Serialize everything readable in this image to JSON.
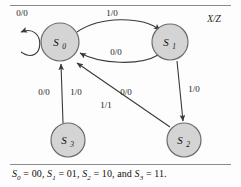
{
  "figure": {
    "type": "state-transition-diagram",
    "legend": "X/Z",
    "caption": "S0 = 00, S1 = 01, S2 = 10, and S3 = 11."
  },
  "states": [
    {
      "id": "S0",
      "name": "S",
      "sub": "0",
      "cx": 60,
      "cy": 42,
      "r": 19,
      "encoding": "00"
    },
    {
      "id": "S1",
      "name": "S",
      "sub": "1",
      "cx": 170,
      "cy": 42,
      "r": 18,
      "encoding": "01"
    },
    {
      "id": "S2",
      "name": "S",
      "sub": "2",
      "cx": 184,
      "cy": 140,
      "r": 17,
      "encoding": "10"
    },
    {
      "id": "S3",
      "name": "S",
      "sub": "3",
      "cx": 68,
      "cy": 140,
      "r": 17,
      "encoding": "11"
    }
  ],
  "transitions": [
    {
      "from": "S0",
      "to": "S0",
      "label": "0/0",
      "kind": "self-loop",
      "lx": 22,
      "ly": 16
    },
    {
      "from": "S0",
      "to": "S1",
      "label": "1/0",
      "kind": "curve-top",
      "lx": 112,
      "ly": 16
    },
    {
      "from": "S1",
      "to": "S0",
      "label": "0/0",
      "kind": "curve-bottom",
      "lx": 116,
      "ly": 55
    },
    {
      "from": "S1",
      "to": "S2",
      "label": "1/0",
      "kind": "vertical",
      "lx": 192,
      "ly": 92
    },
    {
      "from": "S3",
      "to": "S0",
      "label": "0/0",
      "kind": "vertical",
      "lx": 44,
      "ly": 92
    },
    {
      "from": "S3",
      "to": "S0",
      "label": "1/0",
      "kind": "vertical",
      "lx": 73,
      "ly": 92
    },
    {
      "from": "S2",
      "to": "S0",
      "label": "0/0",
      "kind": "diagonal",
      "lx": 124,
      "ly": 92
    },
    {
      "from": "S2",
      "to": "S0",
      "label": "1/1",
      "kind": "diagonal",
      "lx": 105,
      "ly": 106
    }
  ],
  "caption_parts": {
    "s0": "S",
    "s0sub": "0",
    "s0val": "00",
    "s1": "S",
    "s1sub": "1",
    "s1val": "01",
    "s2": "S",
    "s2sub": "2",
    "s2val": "10",
    "s3": "S",
    "s3sub": "3",
    "s3val": "11",
    "and": "and"
  },
  "colors": {
    "state_fill": "#d4d4d4",
    "state_stroke": "#6b6b6b",
    "edge": "#3a3a3a",
    "text": "#111111",
    "rule": "#8a8a8a"
  }
}
